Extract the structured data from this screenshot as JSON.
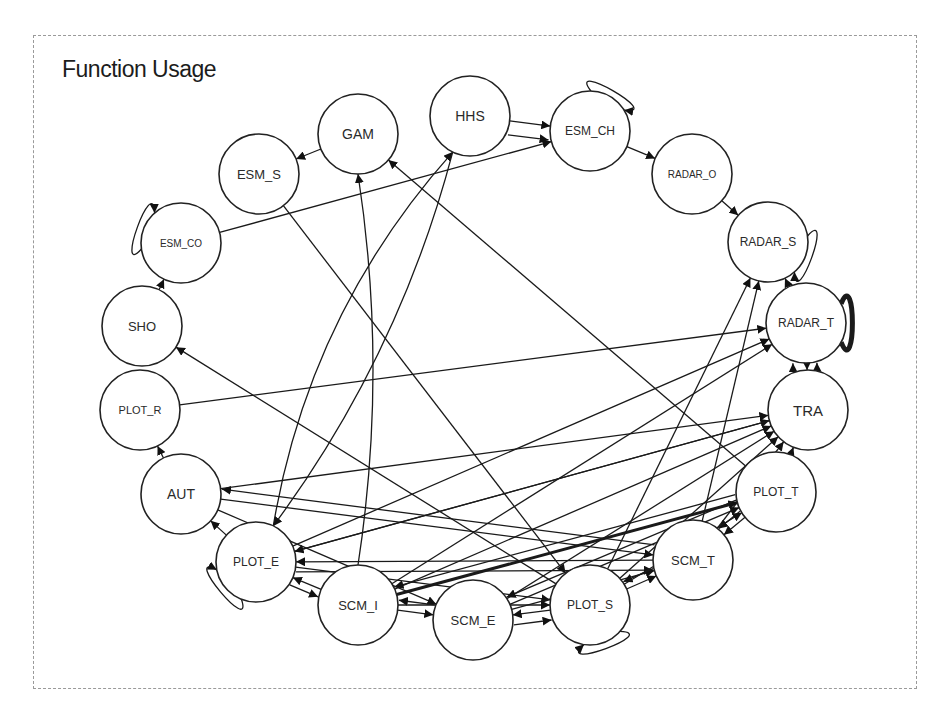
{
  "title": "Function Usage",
  "node_radius": 40,
  "nodes": [
    {
      "id": "HHS",
      "label": "HHS",
      "x": 470,
      "y": 116,
      "font": 14
    },
    {
      "id": "GAM",
      "label": "GAM",
      "x": 358,
      "y": 134,
      "font": 14
    },
    {
      "id": "ESM_CH",
      "label": "ESM_CH",
      "x": 590,
      "y": 131,
      "font": 12
    },
    {
      "id": "ESM_S",
      "label": "ESM_S",
      "x": 259,
      "y": 174,
      "font": 13
    },
    {
      "id": "RADAR_O",
      "label": "RADAR_O",
      "x": 692,
      "y": 174,
      "font": 10
    },
    {
      "id": "ESM_CO",
      "label": "ESM_CO",
      "x": 181,
      "y": 243,
      "font": 10
    },
    {
      "id": "RADAR_S",
      "label": "RADAR_S",
      "x": 768,
      "y": 242,
      "font": 12
    },
    {
      "id": "SHO",
      "label": "SHO",
      "x": 142,
      "y": 326,
      "font": 13
    },
    {
      "id": "RADAR_T",
      "label": "RADAR_T",
      "x": 806,
      "y": 323,
      "font": 12
    },
    {
      "id": "PLOT_R",
      "label": "PLOT_R",
      "x": 140,
      "y": 410,
      "font": 11
    },
    {
      "id": "TRA",
      "label": "TRA",
      "x": 808,
      "y": 410,
      "font": 15
    },
    {
      "id": "AUT",
      "label": "AUT",
      "x": 181,
      "y": 494,
      "font": 14
    },
    {
      "id": "PLOT_T",
      "label": "PLOT_T",
      "x": 776,
      "y": 492,
      "font": 12
    },
    {
      "id": "PLOT_E",
      "label": "PLOT_E",
      "x": 256,
      "y": 562,
      "font": 12
    },
    {
      "id": "SCM_T",
      "label": "SCM_T",
      "x": 693,
      "y": 560,
      "font": 13
    },
    {
      "id": "SCM_I",
      "label": "SCM_I",
      "x": 358,
      "y": 605,
      "font": 13
    },
    {
      "id": "PLOT_S",
      "label": "PLOT_S",
      "x": 590,
      "y": 605,
      "font": 12
    },
    {
      "id": "SCM_E",
      "label": "SCM_E",
      "x": 473,
      "y": 620,
      "font": 13
    }
  ],
  "edges": [
    {
      "from": "HHS",
      "to": "ESM_CH",
      "w": 1
    },
    {
      "from": "HHS",
      "to": "ESM_CH",
      "w": 1,
      "offset": 14
    },
    {
      "from": "GAM",
      "to": "ESM_S",
      "w": 1
    },
    {
      "from": "ESM_CO",
      "to": "ESM_CH",
      "w": 1
    },
    {
      "from": "ESM_CH",
      "to": "RADAR_O",
      "w": 1
    },
    {
      "from": "RADAR_O",
      "to": "RADAR_S",
      "w": 1
    },
    {
      "from": "RADAR_T",
      "to": "RADAR_S",
      "w": 1
    },
    {
      "from": "SHO",
      "to": "ESM_CO",
      "w": 1
    },
    {
      "from": "AUT",
      "to": "PLOT_R",
      "w": 1
    },
    {
      "from": "PLOT_E",
      "to": "AUT",
      "w": 1
    },
    {
      "from": "PLOT_R",
      "to": "RADAR_T",
      "w": 1
    },
    {
      "from": "RADAR_T",
      "to": "TRA",
      "w": 1
    },
    {
      "from": "TRA",
      "to": "RADAR_T",
      "w": 1,
      "offset": 10
    },
    {
      "from": "TRA",
      "to": "RADAR_T",
      "w": 1,
      "offset": -14
    },
    {
      "from": "PLOT_S",
      "to": "SHO",
      "w": 1
    },
    {
      "from": "ESM_S",
      "to": "PLOT_S",
      "w": 1
    },
    {
      "from": "PLOT_T",
      "to": "GAM",
      "w": 1
    },
    {
      "from": "PLOT_E",
      "to": "HHS",
      "w": 1,
      "curve": -60
    },
    {
      "from": "HHS",
      "to": "PLOT_E",
      "w": 1,
      "curve": -40
    },
    {
      "from": "SCM_I",
      "to": "GAM",
      "w": 1,
      "curve": 30
    },
    {
      "from": "PLOT_S",
      "to": "RADAR_S",
      "w": 1
    },
    {
      "from": "SCM_T",
      "to": "RADAR_S",
      "w": 1
    },
    {
      "from": "PLOT_E",
      "to": "RADAR_T",
      "w": 1
    },
    {
      "from": "SCM_I",
      "to": "RADAR_T",
      "w": 1
    },
    {
      "from": "AUT",
      "to": "TRA",
      "w": 1
    },
    {
      "from": "PLOT_E",
      "to": "TRA",
      "w": 1
    },
    {
      "from": "SCM_I",
      "to": "TRA",
      "w": 1
    },
    {
      "from": "SCM_E",
      "to": "TRA",
      "w": 1
    },
    {
      "from": "PLOT_S",
      "to": "TRA",
      "w": 1
    },
    {
      "from": "SCM_T",
      "to": "TRA",
      "w": 1
    },
    {
      "from": "PLOT_T",
      "to": "TRA",
      "w": 1
    },
    {
      "from": "TRA",
      "to": "PLOT_E",
      "w": 1
    },
    {
      "from": "SCM_I",
      "to": "PLOT_T",
      "w": 3
    },
    {
      "from": "PLOT_T",
      "to": "SCM_I",
      "w": 1,
      "offset": 8
    },
    {
      "from": "PLOT_T",
      "to": "SCM_T",
      "w": 1
    },
    {
      "from": "PLOT_T",
      "to": "SCM_T",
      "w": 1,
      "offset": 8
    },
    {
      "from": "AUT",
      "to": "SCM_T",
      "w": 1
    },
    {
      "from": "SCM_T",
      "to": "AUT",
      "w": 1,
      "offset": 10
    },
    {
      "from": "AUT",
      "to": "SCM_E",
      "w": 1
    },
    {
      "from": "SCM_T",
      "to": "PLOT_E",
      "w": 1
    },
    {
      "from": "PLOT_E",
      "to": "SCM_T",
      "w": 1,
      "offset": 10
    },
    {
      "from": "SCM_I",
      "to": "PLOT_E",
      "w": 1
    },
    {
      "from": "PLOT_E",
      "to": "SCM_I",
      "w": 1,
      "offset": 8
    },
    {
      "from": "PLOT_E",
      "to": "PLOT_S",
      "w": 1
    },
    {
      "from": "SCM_I",
      "to": "SCM_E",
      "w": 1
    },
    {
      "from": "SCM_E",
      "to": "SCM_I",
      "w": 1,
      "offset": 10
    },
    {
      "from": "SCM_I",
      "to": "PLOT_S",
      "w": 1
    },
    {
      "from": "PLOT_S",
      "to": "SCM_E",
      "w": 1
    },
    {
      "from": "SCM_E",
      "to": "PLOT_S",
      "w": 1,
      "offset": 10
    },
    {
      "from": "SCM_E",
      "to": "SCM_T",
      "w": 1
    },
    {
      "from": "PLOT_S",
      "to": "SCM_T",
      "w": 1
    },
    {
      "from": "SCM_T",
      "to": "PLOT_S",
      "w": 1,
      "offset": 8
    },
    {
      "from": "SCM_E",
      "to": "PLOT_T",
      "w": 1
    },
    {
      "from": "PLOT_T",
      "to": "SCM_E",
      "w": 1,
      "offset": 8
    },
    {
      "from": "PLOT_S",
      "to": "PLOT_T",
      "w": 1
    }
  ],
  "self_loops": [
    {
      "node": "ESM_CH",
      "angle": -60,
      "w": 1
    },
    {
      "node": "ESM_CO",
      "angle": 200,
      "w": 1
    },
    {
      "node": "RADAR_S",
      "angle": 20,
      "w": 1
    },
    {
      "node": "RADAR_T",
      "angle": 0,
      "w": 5
    },
    {
      "node": "PLOT_E",
      "angle": 140,
      "w": 1
    },
    {
      "node": "PLOT_S",
      "angle": 70,
      "w": 1
    }
  ]
}
